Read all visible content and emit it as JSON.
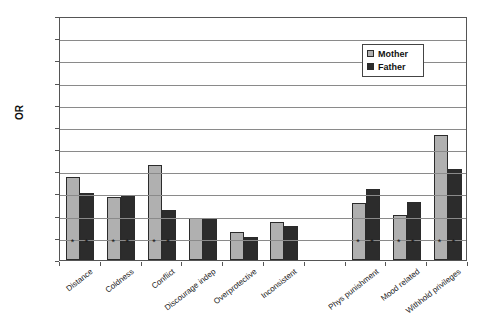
{
  "chart_data": {
    "type": "bar",
    "title": "",
    "xlabel": "",
    "ylabel": "OR",
    "ylim": [
      0.8,
      3
    ],
    "ytick_step": 0.2,
    "yticks": [
      "3",
      "2.8",
      "2.6",
      "2.4",
      "2.2",
      "2",
      "1.8",
      "1.6",
      "1.4",
      "1.2",
      "1",
      "0.8"
    ],
    "grid": true,
    "legend_position": "upper-right",
    "baseline": 0.8,
    "categories": [
      "Distance",
      "Coldness",
      "Conflict",
      "Discourage indep",
      "Overprotective",
      "Inconsistent",
      "",
      "Phys punishment",
      "Mood related",
      "Withhold privileges"
    ],
    "series": [
      {
        "name": "Mother",
        "color": "#b0b0b0",
        "values": [
          1.55,
          1.37,
          1.66,
          1.18,
          1.05,
          1.14,
          null,
          1.31,
          1.21,
          1.93
        ]
      },
      {
        "name": "Father",
        "color": "#2c2c2c",
        "values": [
          1.4,
          1.38,
          1.25,
          1.17,
          1.01,
          1.11,
          null,
          1.44,
          1.32,
          1.62
        ]
      }
    ],
    "significance_markers": {
      "symbol": "*",
      "mother": [
        true,
        true,
        true,
        false,
        false,
        false,
        false,
        true,
        true,
        true
      ],
      "father": [
        true,
        true,
        true,
        false,
        false,
        false,
        false,
        true,
        true,
        true
      ]
    }
  },
  "legend": {
    "items": [
      {
        "label": "Mother"
      },
      {
        "label": "Father"
      }
    ]
  }
}
